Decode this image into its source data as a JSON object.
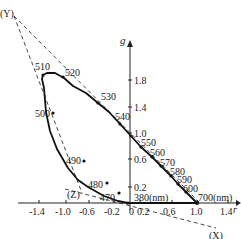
{
  "diagram": {
    "type": "rg chromaticity diagram (spectral locus with XYZ primaries)",
    "axes": {
      "x_label": "r",
      "y_label": "g",
      "x_ticks": [
        "-1.4",
        "-1.0",
        "-0.6",
        "-0.2",
        "0",
        "0.2",
        "0.6",
        "1.0",
        "1.4"
      ],
      "y_ticks": [
        "1.8",
        "1.4",
        "1.0",
        "0.6",
        "0.2"
      ]
    },
    "primaries": {
      "X": "(X)",
      "Y": "(Y)",
      "Z": "(Z)"
    },
    "wavelength_labels": {
      "w380": "380(nm)",
      "w470": "470",
      "w480": "480",
      "w490": "490",
      "w500": "500",
      "w510": "510",
      "w520": "520",
      "w530": "530",
      "w540": "540",
      "w550": "550",
      "w560": "560",
      "w570": "570",
      "w580": "580",
      "w590": "590",
      "w600": "600",
      "w700": "700(nm)"
    },
    "colors": {
      "ink": "#222222",
      "background": "#ffffff"
    }
  }
}
